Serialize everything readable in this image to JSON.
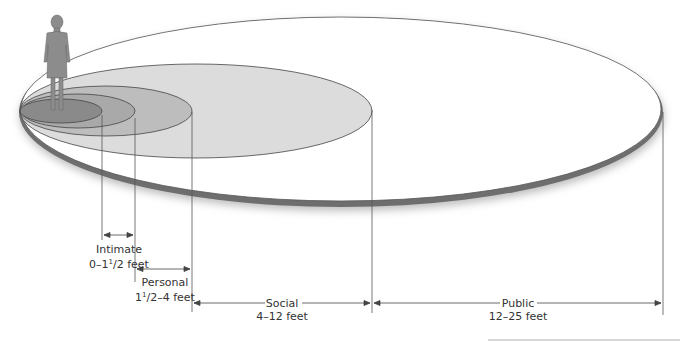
{
  "diagram": {
    "type": "proxemics-zones",
    "zones": [
      {
        "name": "Intimate",
        "range_pre": "0–1",
        "sup": "1",
        "range_post": "/2 feet",
        "fill": "#8a8a8a"
      },
      {
        "name": "Personal",
        "range_pre": "1",
        "sup": "1",
        "range_post": "/2–4 feet",
        "fill": "#a9a9a9"
      },
      {
        "name": "Social",
        "range": "4–12 feet",
        "fill": "#dcdcdc"
      },
      {
        "name": "Public",
        "range": "12–25 feet",
        "fill": "#ffffff"
      }
    ],
    "colors": {
      "outline": "#444444",
      "rim": "#6e6e6e",
      "figure": "#8c8c8c"
    }
  }
}
